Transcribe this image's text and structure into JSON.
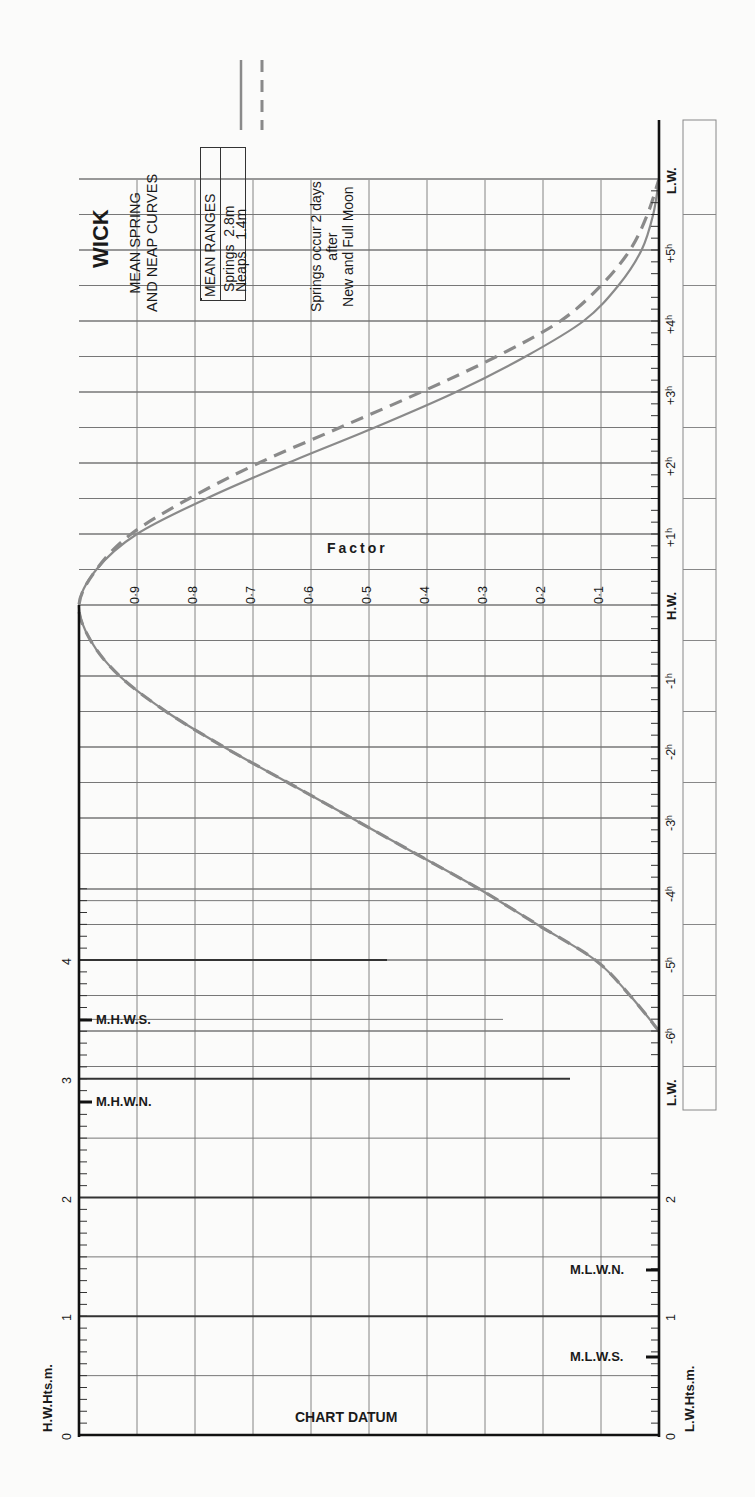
{
  "header": {
    "title": "WICK",
    "subtitle_line1": "MEAN SPRING",
    "subtitle_line2": "AND NEAP CURVES",
    "note_line1": "Springs occur 2 days",
    "note_line2": "after",
    "note_line3": "New and Full Moon"
  },
  "legend": {
    "header": "MEAN RANGES",
    "springs_label": "Springs",
    "springs_value": "2.8m",
    "neaps_label": "Neaps",
    "neaps_value": "1.4m"
  },
  "axes": {
    "factor_title": "Factor",
    "factor_ticks": [
      "0·9",
      "0·8",
      "0·7",
      "0·6",
      "0·5",
      "0·4",
      "0·3",
      "0·2",
      "0·1"
    ],
    "time_ticks": [
      "L.W.",
      "-6h",
      "-5h",
      "-4h",
      "-3h",
      "-2h",
      "-1h",
      "H.W.",
      "+1h",
      "+2h",
      "+3h",
      "+4h",
      "+5h",
      "L.W."
    ],
    "hw_height_title": "H.W.Hts.m.",
    "lw_height_title": "L.W.Hts.m.",
    "hw_height_ticks": [
      "0",
      "1",
      "2",
      "3",
      "4"
    ],
    "lw_height_ticks": [
      "0",
      "1",
      "2"
    ],
    "chart_datum": "CHART DATUM",
    "mhws": "M.H.W.S.",
    "mhwn": "M.H.W.N.",
    "mlwn": "M.L.W.N.",
    "mlws": "M.L.W.S."
  },
  "colors": {
    "curve": "#8a8a8a",
    "grid": "#777777",
    "axis": "#111111",
    "background": "#fbfbfa"
  },
  "chart_data": {
    "type": "line",
    "xlabel": "Time relative to High Water (hours)",
    "ylabel": "Factor",
    "x": [
      -6,
      -5.5,
      -5,
      -4.5,
      -4,
      -3.5,
      -3,
      -2.5,
      -2,
      -1.5,
      -1,
      -0.5,
      0,
      0.5,
      1,
      1.5,
      2,
      2.5,
      3,
      3.5,
      4,
      4.5,
      5,
      5.5,
      6
    ],
    "series": [
      {
        "name": "Springs (mean range 2.8m)",
        "style": "solid",
        "values": [
          0.0,
          0.05,
          0.11,
          0.21,
          0.31,
          0.42,
          0.53,
          0.64,
          0.75,
          0.85,
          0.93,
          0.98,
          1.0,
          0.97,
          0.9,
          0.78,
          0.64,
          0.49,
          0.35,
          0.23,
          0.13,
          0.07,
          0.03,
          0.01,
          0.0
        ]
      },
      {
        "name": "Neaps (mean range 1.4m)",
        "style": "dashed",
        "values": [
          0.0,
          0.05,
          0.11,
          0.21,
          0.31,
          0.42,
          0.53,
          0.64,
          0.75,
          0.85,
          0.93,
          0.98,
          1.0,
          0.97,
          0.91,
          0.81,
          0.69,
          0.55,
          0.41,
          0.28,
          0.17,
          0.1,
          0.05,
          0.02,
          0.0
        ]
      }
    ],
    "xlim": [
      -6,
      6
    ],
    "ylim": [
      0,
      1
    ],
    "height_scale": {
      "hw_range_m": [
        0,
        4.5
      ],
      "lw_range_m": [
        0,
        2.2
      ],
      "mhws_m": 3.5,
      "mhwn_m": 2.8,
      "mlwn_m": 1.4,
      "mlws_m": 0.7
    },
    "grid": true,
    "legend_position": "top"
  }
}
